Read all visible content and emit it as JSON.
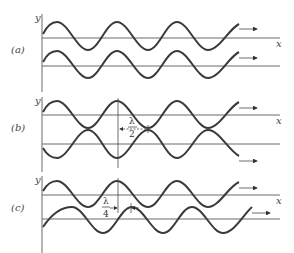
{
  "panels": [
    {
      "id": "a",
      "label": "(a)",
      "y_axis_label": "y",
      "x_axis_label": "x",
      "phase_relation": "in phase",
      "annotation": ""
    },
    {
      "id": "b",
      "label": "(b)",
      "y_axis_label": "y",
      "x_axis_label": "x",
      "phase_relation": "out of phase by half wavelength",
      "annotation": {
        "numerator": "λ",
        "denominator": "2"
      }
    },
    {
      "id": "c",
      "label": "(c)",
      "y_axis_label": "y",
      "x_axis_label": "x",
      "phase_relation": "out of phase by quarter wavelength",
      "annotation": {
        "numerator": "λ",
        "denominator": "4"
      }
    }
  ],
  "arrow_icon": "right-arrow",
  "colors": {
    "wave": "#3a3a3a",
    "axis": "#6a6a6a",
    "background": "#ffffff"
  }
}
